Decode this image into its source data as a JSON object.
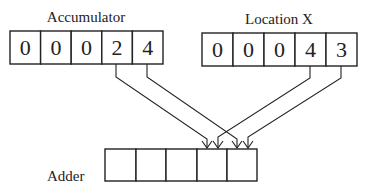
{
  "accumulator": {
    "label": "Accumulator",
    "digits": [
      "0",
      "0",
      "0",
      "2",
      "4"
    ]
  },
  "location_x": {
    "label": "Location X",
    "digits": [
      "0",
      "0",
      "0",
      "4",
      "3"
    ]
  },
  "adder": {
    "label": "Adder",
    "cells": [
      "",
      "",
      "",
      "",
      ""
    ]
  }
}
